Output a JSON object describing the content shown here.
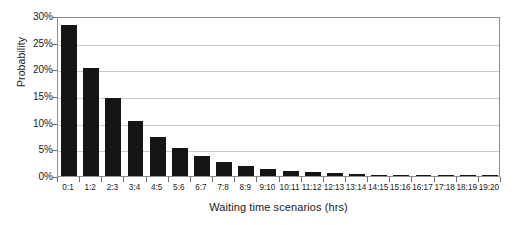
{
  "chart_data": {
    "type": "bar",
    "title": "",
    "xlabel": "Waiting time scenarios (hrs)",
    "ylabel": "Probability",
    "categories": [
      "0:1",
      "1:2",
      "2:3",
      "3:4",
      "4:5",
      "5:6",
      "6:7",
      "7:8",
      "8:9",
      "9:10",
      "10:11",
      "11:12",
      "12:13",
      "13:14",
      "14:15",
      "15:16",
      "16:17",
      "17:18",
      "18:19",
      "19:20"
    ],
    "values": [
      28.3,
      20.3,
      14.6,
      10.4,
      7.4,
      5.3,
      3.8,
      2.7,
      1.9,
      1.4,
      1.0,
      0.7,
      0.5,
      0.35,
      0.25,
      0.2,
      0.15,
      0.1,
      0.08,
      0.05
    ],
    "ylim": [
      0,
      30
    ],
    "yticks": [
      "0%",
      "5%",
      "10%",
      "15%",
      "20%",
      "25%",
      "30%"
    ],
    "ytick_values": [
      0,
      5,
      10,
      15,
      20,
      25,
      30
    ],
    "grid": true,
    "legend": "none",
    "bar_color": "#151515",
    "grid_color": "#c9c9c9",
    "frame_color": "#8d8d8d",
    "background": "#ffffff"
  }
}
